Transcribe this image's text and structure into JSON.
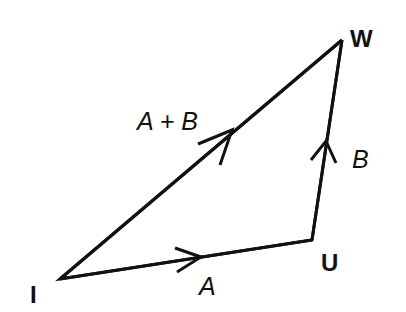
{
  "diagram": {
    "type": "vector-triangle",
    "vertices": [
      {
        "id": "I",
        "label": "I",
        "x": 60,
        "y": 279,
        "label_x": 30,
        "label_y": 303
      },
      {
        "id": "U",
        "label": "U",
        "x": 312,
        "y": 240,
        "label_x": 322,
        "label_y": 271
      },
      {
        "id": "W",
        "label": "W",
        "x": 342,
        "y": 40,
        "label_x": 352,
        "label_y": 47
      }
    ],
    "edges": [
      {
        "from": "I",
        "to": "U",
        "label": "A",
        "label_x": 198,
        "label_y": 295
      },
      {
        "from": "U",
        "to": "W",
        "label": "B",
        "label_x": 352,
        "label_y": 168
      },
      {
        "from": "I",
        "to": "W",
        "label": "A + B",
        "label_x": 137,
        "label_y": 130
      }
    ],
    "colors": {
      "stroke": "#111111",
      "background": "#ffffff"
    }
  },
  "labels": {
    "vertex_I": "I",
    "vertex_U": "U",
    "vertex_W": "W",
    "edge_A": "A",
    "edge_B": "B",
    "edge_AB": "A + B"
  }
}
